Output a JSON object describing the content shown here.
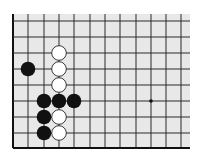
{
  "board": {
    "background": "#e8e8e8",
    "line_color": "#2a2a2a",
    "edge_color": "#111111",
    "columns_x": [
      13,
      28,
      44,
      59,
      74,
      90,
      105,
      120,
      136,
      151,
      166,
      181
    ],
    "rows_y": [
      21,
      37,
      53,
      69,
      85,
      101,
      117,
      133,
      148
    ],
    "top_edge_y": 14,
    "right_edge_x": 190,
    "left_edge_is_board_edge": true,
    "bottom_edge_is_board_edge": true,
    "star_points": [
      {
        "col": 9,
        "row": 5
      }
    ]
  },
  "stones": [
    {
      "color": "white",
      "col": 3,
      "row": 2
    },
    {
      "color": "white",
      "col": 3,
      "row": 3
    },
    {
      "color": "white",
      "col": 3,
      "row": 4
    },
    {
      "color": "white",
      "col": 3,
      "row": 6
    },
    {
      "color": "white",
      "col": 3,
      "row": 7
    },
    {
      "color": "black",
      "col": 1,
      "row": 3
    },
    {
      "color": "black",
      "col": 2,
      "row": 5
    },
    {
      "color": "black",
      "col": 3,
      "row": 5
    },
    {
      "color": "black",
      "col": 4,
      "row": 5
    },
    {
      "color": "black",
      "col": 2,
      "row": 6
    },
    {
      "color": "black",
      "col": 2,
      "row": 7
    }
  ],
  "stone_colors": {
    "black": "#111111",
    "white": "#ffffff",
    "white_outline": "#222222"
  }
}
